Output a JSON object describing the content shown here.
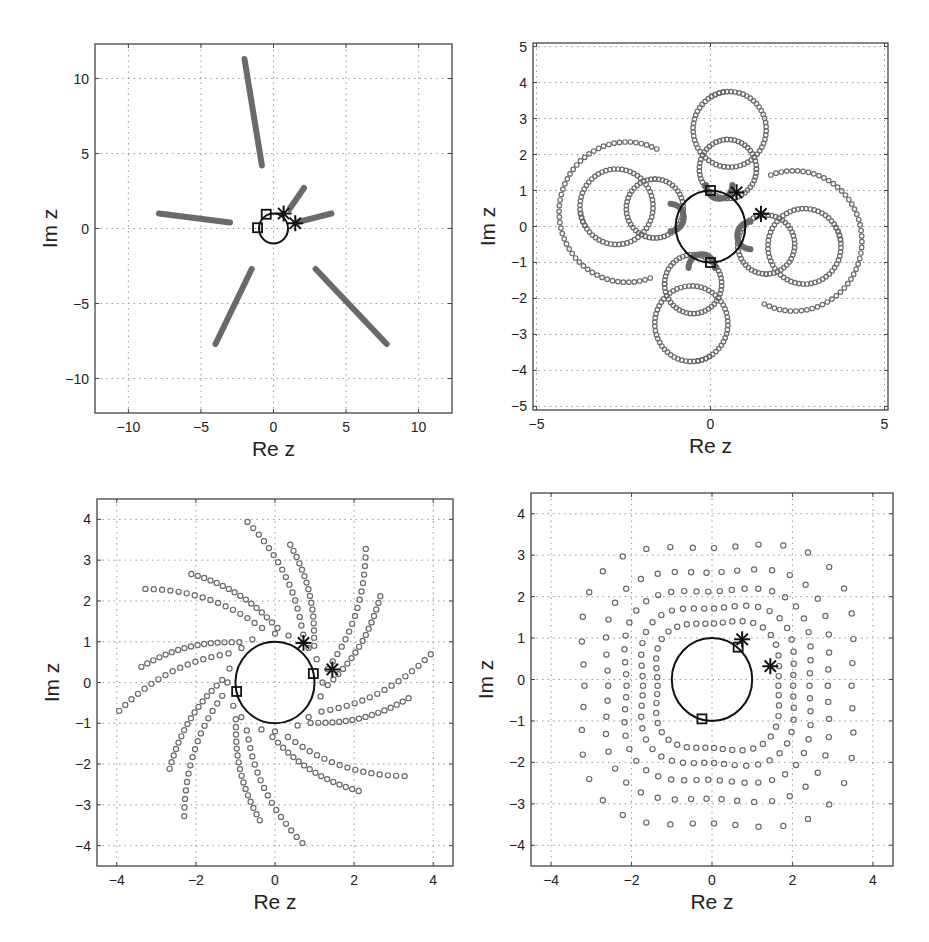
{
  "figure": {
    "width": 929,
    "height": 942,
    "background": "#ffffff",
    "colors": {
      "axes": "#444444",
      "grid": "#9a9a9a",
      "trajectory": "#6a6a6a",
      "unit_circle": "#111111",
      "markers": "#111111"
    }
  },
  "chart_data": [
    {
      "id": "panel-top-left",
      "type": "scatter",
      "title": "",
      "xlabel": "Re z",
      "ylabel": "Im z",
      "xlim": [
        -12.3,
        12.3
      ],
      "ylim": [
        -12.3,
        12.3
      ],
      "xticks": [
        -10,
        -5,
        0,
        5,
        10
      ],
      "yticks": [
        -10,
        -5,
        0,
        5,
        10
      ],
      "xtick_labels": [
        "−10",
        "−5",
        "0",
        "5",
        "10"
      ],
      "ytick_labels": [
        "−10",
        "−5",
        "0",
        "5",
        "10"
      ],
      "grid": true,
      "box_px": {
        "left": 95,
        "top": 44,
        "right": 452,
        "bottom": 413
      },
      "unit_circle": {
        "center": [
          0,
          0
        ],
        "radius": 1
      },
      "series": [
        {
          "name": "trajectory-1",
          "style": "thick-line",
          "points": [
            [
              -2.0,
              11.3
            ],
            [
              -0.8,
              4.2
            ]
          ]
        },
        {
          "name": "trajectory-2",
          "style": "thick-line",
          "points": [
            [
              -7.9,
              1.0
            ],
            [
              -3.0,
              0.4
            ]
          ]
        },
        {
          "name": "trajectory-3",
          "style": "thick-line",
          "points": [
            [
              -4.0,
              -7.7
            ],
            [
              -1.5,
              -2.7
            ]
          ]
        },
        {
          "name": "trajectory-4",
          "style": "thick-line",
          "points": [
            [
              2.9,
              -2.7
            ],
            [
              7.8,
              -7.7
            ]
          ]
        },
        {
          "name": "trajectory-5",
          "style": "thick-line",
          "points": [
            [
              1.1,
              1.3
            ],
            [
              2.1,
              2.7
            ]
          ]
        },
        {
          "name": "trajectory-6",
          "style": "thick-line",
          "points": [
            [
              1.7,
              0.45
            ],
            [
              4.0,
              1.0
            ]
          ]
        }
      ],
      "square_markers": [
        [
          -0.5,
          0.95
        ],
        [
          -1.1,
          0.05
        ]
      ],
      "star_markers": [
        [
          0.7,
          1.0
        ],
        [
          1.5,
          0.35
        ]
      ]
    },
    {
      "id": "panel-top-right",
      "type": "scatter",
      "title": "",
      "xlabel": "Re z",
      "ylabel": "Im z",
      "xlim": [
        -5.1,
        5.1
      ],
      "ylim": [
        -5.1,
        5.1
      ],
      "xticks": [
        -5,
        0,
        5
      ],
      "yticks": [
        -5,
        -4,
        -3,
        -2,
        -1,
        0,
        1,
        2,
        3,
        4,
        5
      ],
      "xtick_labels": [
        "−5",
        "0",
        "5"
      ],
      "ytick_labels": [
        "−5",
        "−4",
        "−3",
        "−2",
        "−1",
        "0",
        "1",
        "2",
        "3",
        "4",
        "5"
      ],
      "grid": true,
      "box_px": {
        "left": 533,
        "top": 43,
        "right": 888,
        "bottom": 410
      },
      "unit_circle": {
        "center": [
          0,
          0
        ],
        "radius": 1
      },
      "series": [
        {
          "name": "loop-large",
          "style": "open-circles",
          "kind": "arc",
          "center": [
            0.55,
            2.7
          ],
          "radius": 1.05,
          "a0": 100,
          "a1": 480,
          "n": 60,
          "rotations": [
            0,
            90,
            180,
            270
          ]
        },
        {
          "name": "loop-medium",
          "style": "open-circles",
          "kind": "arc",
          "center": [
            0.5,
            1.6
          ],
          "radius": 0.82,
          "a0": 0,
          "a1": 360,
          "n": 48,
          "rotations": [
            0,
            90,
            180,
            270
          ]
        },
        {
          "name": "loop-small",
          "style": "thick-line",
          "kind": "arc",
          "center": [
            0.25,
            1.15
          ],
          "radius": 0.38,
          "a0": 180,
          "a1": 360,
          "n": 30,
          "rotations": [
            0,
            90,
            180,
            270
          ]
        },
        {
          "name": "tail",
          "style": "open-circles",
          "kind": "arc",
          "center": [
            -2.4,
            0.4
          ],
          "radius": 1.95,
          "a0": 64,
          "a1": 290,
          "n": 50,
          "rotations": [
            0,
            180
          ]
        }
      ],
      "square_markers": [
        [
          0.0,
          1.0
        ],
        [
          0.0,
          -1.0
        ]
      ],
      "star_markers": [
        [
          0.75,
          0.95
        ],
        [
          1.45,
          0.35
        ]
      ]
    },
    {
      "id": "panel-bottom-left",
      "type": "scatter",
      "title": "",
      "xlabel": "Re z",
      "ylabel": "Im z",
      "xlim": [
        -4.5,
        4.5
      ],
      "ylim": [
        -4.5,
        4.5
      ],
      "xticks": [
        -4,
        -2,
        0,
        2,
        4
      ],
      "yticks": [
        -4,
        -3,
        -2,
        -1,
        0,
        1,
        2,
        3,
        4
      ],
      "xtick_labels": [
        "−4",
        "−2",
        "0",
        "2",
        "4"
      ],
      "ytick_labels": [
        "−4",
        "−3",
        "−2",
        "−1",
        "0",
        "1",
        "2",
        "3",
        "4"
      ],
      "grid": true,
      "box_px": {
        "left": 97,
        "top": 499,
        "right": 453,
        "bottom": 866
      },
      "unit_circle": {
        "center": [
          0,
          0
        ],
        "radius": 1
      },
      "series": [
        {
          "name": "spiral-arms",
          "style": "open-circles",
          "kind": "spiral",
          "arms": 16,
          "r0": 1.2,
          "r1": 4.0,
          "twist_deg": 55,
          "n": 17
        }
      ],
      "square_markers": [
        [
          -0.97,
          -0.22
        ],
        [
          0.97,
          0.22
        ]
      ],
      "star_markers": [
        [
          0.72,
          0.97
        ],
        [
          1.45,
          0.32
        ]
      ]
    },
    {
      "id": "panel-bottom-right",
      "type": "scatter",
      "title": "",
      "xlabel": "Re z",
      "ylabel": "Im z",
      "xlim": [
        -4.5,
        4.5
      ],
      "ylim": [
        -4.5,
        4.5
      ],
      "xticks": [
        -4,
        -2,
        0,
        2,
        4
      ],
      "yticks": [
        -4,
        -3,
        -2,
        -1,
        0,
        1,
        2,
        3,
        4
      ],
      "xtick_labels": [
        "−4",
        "−2",
        "0",
        "2",
        "4"
      ],
      "ytick_labels": [
        "−4",
        "−3",
        "−2",
        "−1",
        "0",
        "1",
        "2",
        "3",
        "4"
      ],
      "grid": true,
      "box_px": {
        "left": 531,
        "top": 493,
        "right": 893,
        "bottom": 866
      },
      "unit_circle": {
        "center": [
          0,
          0
        ],
        "radius": 1
      },
      "series": [
        {
          "name": "wavy-loops",
          "style": "open-circles",
          "kind": "wavy",
          "radii": [
            1.65,
            2.05,
            2.5,
            3.0,
            3.65
          ],
          "wave_amp": 0.18,
          "lobes": 4,
          "n": [
            44,
            48,
            50,
            46,
            40
          ]
        }
      ],
      "square_markers": [
        [
          0.65,
          0.78
        ],
        [
          -0.25,
          -0.95
        ]
      ],
      "star_markers": [
        [
          0.75,
          0.97
        ],
        [
          1.45,
          0.32
        ]
      ]
    }
  ]
}
